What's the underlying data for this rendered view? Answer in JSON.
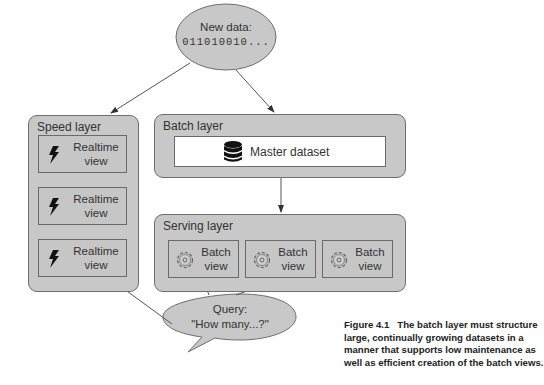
{
  "new_data": {
    "title": "New data:",
    "value": "011010010..."
  },
  "speed_layer": {
    "title": "Speed layer",
    "views": [
      {
        "line1": "Realtime",
        "line2": "view",
        "icon": "lightning-icon"
      },
      {
        "line1": "Realtime",
        "line2": "view",
        "icon": "lightning-icon"
      },
      {
        "line1": "Realtime",
        "line2": "view",
        "icon": "lightning-icon"
      }
    ]
  },
  "batch_layer": {
    "title": "Batch layer",
    "master": {
      "label": "Master dataset",
      "icon": "database-icon"
    }
  },
  "serving_layer": {
    "title": "Serving layer",
    "views": [
      {
        "line1": "Batch",
        "line2": "view",
        "icon": "gear-icon"
      },
      {
        "line1": "Batch",
        "line2": "view",
        "icon": "gear-icon"
      },
      {
        "line1": "Batch",
        "line2": "view",
        "icon": "gear-icon"
      }
    ]
  },
  "query": {
    "line1": "Query:",
    "line2": "\"How many...?\""
  },
  "caption": {
    "label": "Figure 4.1",
    "text": "The batch layer must structure large, continually growing datasets in a manner that supports low maintenance as well as efficient creation of the batch views."
  },
  "colors": {
    "box_fill": "#c8c8c8",
    "border": "#6e6e6e",
    "text": "#333333"
  }
}
